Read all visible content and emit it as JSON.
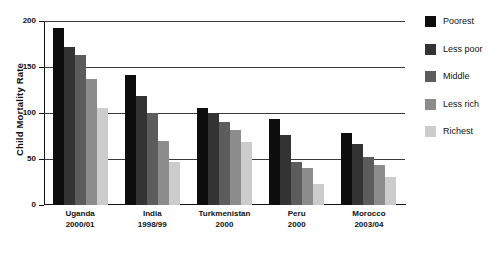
{
  "chart_data": {
    "type": "bar",
    "title": "",
    "xlabel": "",
    "ylabel": "Child Mortality Rate",
    "ylim": [
      0,
      200
    ],
    "yticks": [
      0,
      50,
      100,
      150,
      200
    ],
    "grid": true,
    "legend_position": "right",
    "categories": [
      {
        "line1": "Uganda",
        "line2": "2000/01"
      },
      {
        "line1": "India",
        "line2": "1998/99"
      },
      {
        "line1": "Turkmenistan",
        "line2": "2000"
      },
      {
        "line1": "Peru",
        "line2": "2000"
      },
      {
        "line1": "Morocco",
        "line2": "2003/04"
      }
    ],
    "category_labels": [
      "Uganda 2000/01",
      "India 1998/99",
      "Turkmenistan 2000",
      "Peru 2000",
      "Morocco 2003/04"
    ],
    "series": [
      {
        "name": "Poorest",
        "color": "#0d0d0d",
        "values": [
          192,
          141,
          105,
          93,
          78
        ]
      },
      {
        "name": "Less poor",
        "color": "#333333",
        "values": [
          172,
          118,
          100,
          76,
          66
        ]
      },
      {
        "name": "Middle",
        "color": "#5c5c5c",
        "values": [
          163,
          100,
          90,
          47,
          52
        ]
      },
      {
        "name": "Less rich",
        "color": "#8c8c8c",
        "values": [
          137,
          70,
          82,
          40,
          44
        ]
      },
      {
        "name": "Richest",
        "color": "#cccccc",
        "values": [
          105,
          47,
          68,
          23,
          30
        ]
      }
    ]
  },
  "legend": {
    "items": [
      {
        "label": "Poorest",
        "color": "#0d0d0d"
      },
      {
        "label": "Less poor",
        "color": "#333333"
      },
      {
        "label": "Middle",
        "color": "#5c5c5c"
      },
      {
        "label": "Less rich",
        "color": "#8c8c8c"
      },
      {
        "label": "Richest",
        "color": "#cccccc"
      }
    ]
  }
}
